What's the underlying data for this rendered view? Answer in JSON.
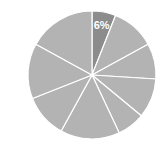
{
  "chart_data": {
    "type": "pie",
    "title": "",
    "start_angle_deg": 0,
    "direction": "clockwise",
    "center": [
      92,
      75
    ],
    "radius": 64,
    "slice_border_color": "#ffffff",
    "slices": [
      {
        "label": "6%",
        "value": 6,
        "show_label": true,
        "color": "#8c8c8c"
      },
      {
        "label": "",
        "value": 11,
        "show_label": false,
        "color": "#b3b3b3"
      },
      {
        "label": "",
        "value": 9,
        "show_label": false,
        "color": "#b3b3b3"
      },
      {
        "label": "",
        "value": 10,
        "show_label": false,
        "color": "#b3b3b3"
      },
      {
        "label": "",
        "value": 7,
        "show_label": false,
        "color": "#b3b3b3"
      },
      {
        "label": "",
        "value": 15,
        "show_label": false,
        "color": "#b3b3b3"
      },
      {
        "label": "",
        "value": 11,
        "show_label": false,
        "color": "#b3b3b3"
      },
      {
        "label": "",
        "value": 14,
        "show_label": false,
        "color": "#b3b3b3"
      },
      {
        "label": "",
        "value": 17,
        "show_label": false,
        "color": "#b3b3b3"
      }
    ],
    "highlighted_label": "6%"
  }
}
